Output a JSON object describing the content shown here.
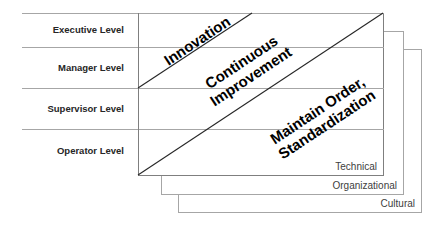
{
  "diagram": {
    "levels": [
      {
        "label": "Executive Level"
      },
      {
        "label": "Manager Level"
      },
      {
        "label": "Supervisor Level"
      },
      {
        "label": "Operator Level"
      }
    ],
    "bands": [
      {
        "label_line1": "Innovation",
        "label_line2": ""
      },
      {
        "label_line1": "Continuous",
        "label_line2": "Improvement"
      },
      {
        "label_line1": "Maintain Order,",
        "label_line2": "Standardization"
      }
    ],
    "layers": [
      {
        "label": "Technical"
      },
      {
        "label": "Organizational"
      },
      {
        "label": "Cultural"
      }
    ],
    "colors": {
      "grid_line": "#a6a6a6",
      "diagonal_line": "#262626",
      "text": "#000000"
    }
  }
}
